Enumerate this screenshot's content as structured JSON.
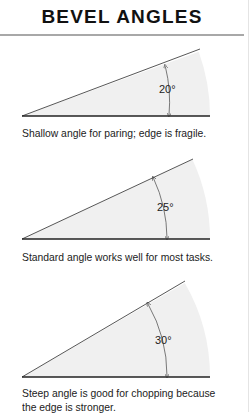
{
  "title": "BEVEL ANGLES",
  "diagrams": [
    {
      "angle_label": "20°",
      "angle_deg": 20,
      "caption": "Shallow angle for paring; edge is fragile."
    },
    {
      "angle_label": "25°",
      "angle_deg": 25,
      "caption": "Standard angle works well for most tasks."
    },
    {
      "angle_label": "30°",
      "angle_deg": 30,
      "caption": "Steep angle is good for chopping because the edge is stronger."
    }
  ],
  "colors": {
    "wedge_fill": "#f0f0f0",
    "line": "#333333",
    "rule": "#a8a8a8"
  }
}
